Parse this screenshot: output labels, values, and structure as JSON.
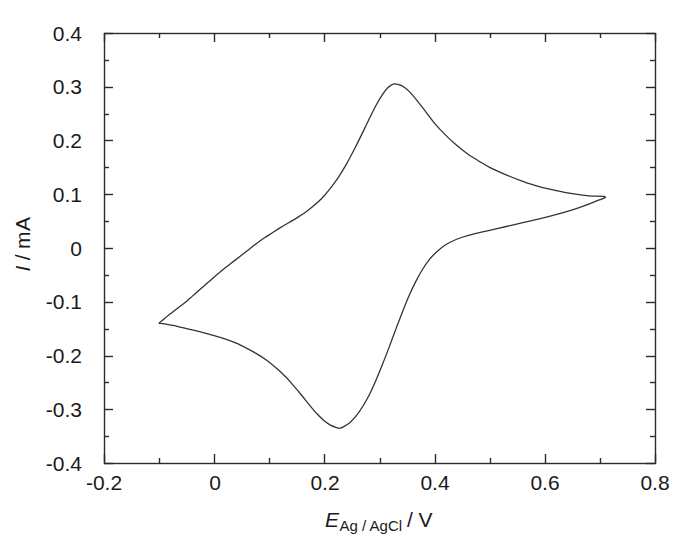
{
  "chart_data": {
    "type": "line",
    "title": "",
    "subtitle": "",
    "xlabel": "E_Ag/AgCl / V",
    "xlabel_parts": {
      "symbol": "E",
      "subscript": "Ag / AgCl",
      "separator": "/",
      "unit": "V"
    },
    "ylabel": "I / mA",
    "ylabel_parts": {
      "symbol": "I",
      "separator": "/",
      "unit": "mA"
    },
    "xlim": [
      -0.2,
      0.8
    ],
    "ylim": [
      -0.4,
      0.4
    ],
    "grid": false,
    "legend": "none",
    "x_major_ticks": [
      -0.2,
      0,
      0.2,
      0.4,
      0.6,
      0.8
    ],
    "x_tick_labels": [
      "-0.2",
      "0",
      "0.2",
      "0.4",
      "0.6",
      "0.8"
    ],
    "x_minor_ticks": [
      -0.1,
      0.1,
      0.3,
      0.5,
      0.7
    ],
    "y_major_ticks": [
      0.4,
      0.3,
      0.2,
      0.1,
      0,
      -0.1,
      -0.2,
      -0.3,
      -0.4
    ],
    "y_tick_labels": [
      "0.4",
      "0.3",
      "0.2",
      "0.1",
      "0",
      "-0.1",
      "-0.2",
      "-0.3",
      "-0.4"
    ],
    "y_minor_ticks": [
      0.35,
      0.25,
      0.15,
      0.05,
      -0.05,
      -0.15,
      -0.25,
      -0.35
    ],
    "tick_direction": "in",
    "frame": "box",
    "line_color": "#333333",
    "line_width_px": 1.3,
    "annotations": {
      "anodic_peak": {
        "x": 0.325,
        "y": 0.305,
        "label": "anodic peak current"
      },
      "cathodic_peak": {
        "x": 0.229,
        "y": -0.335,
        "label": "cathodic peak current"
      },
      "anodic_switching_potential": {
        "x": 0.71,
        "y": 0.095
      },
      "cathodic_switching_potential": {
        "x": -0.1,
        "y": -0.14
      }
    },
    "series": [
      {
        "name": "forward scan (anodic, -0.1 V to 0.71 V)",
        "direction": "anodic",
        "points": [
          [
            -0.1,
            -0.14
          ],
          [
            -0.09,
            -0.131
          ],
          [
            -0.08,
            -0.123
          ],
          [
            -0.07,
            -0.115
          ],
          [
            -0.06,
            -0.107
          ],
          [
            -0.05,
            -0.099
          ],
          [
            -0.04,
            -0.09
          ],
          [
            -0.03,
            -0.081
          ],
          [
            -0.02,
            -0.072
          ],
          [
            -0.01,
            -0.063
          ],
          [
            0.0,
            -0.054
          ],
          [
            0.015,
            -0.041
          ],
          [
            0.03,
            -0.029
          ],
          [
            0.045,
            -0.017
          ],
          [
            0.06,
            -0.005
          ],
          [
            0.075,
            0.007
          ],
          [
            0.09,
            0.018
          ],
          [
            0.105,
            0.028
          ],
          [
            0.12,
            0.038
          ],
          [
            0.135,
            0.047
          ],
          [
            0.15,
            0.056
          ],
          [
            0.165,
            0.066
          ],
          [
            0.18,
            0.078
          ],
          [
            0.195,
            0.092
          ],
          [
            0.21,
            0.11
          ],
          [
            0.225,
            0.131
          ],
          [
            0.24,
            0.156
          ],
          [
            0.255,
            0.185
          ],
          [
            0.27,
            0.216
          ],
          [
            0.285,
            0.248
          ],
          [
            0.295,
            0.268
          ],
          [
            0.305,
            0.285
          ],
          [
            0.315,
            0.298
          ],
          [
            0.325,
            0.305
          ],
          [
            0.335,
            0.304
          ],
          [
            0.345,
            0.299
          ],
          [
            0.355,
            0.29
          ],
          [
            0.37,
            0.272
          ],
          [
            0.385,
            0.252
          ],
          [
            0.4,
            0.232
          ],
          [
            0.42,
            0.21
          ],
          [
            0.44,
            0.191
          ],
          [
            0.46,
            0.175
          ],
          [
            0.48,
            0.162
          ],
          [
            0.5,
            0.15
          ],
          [
            0.53,
            0.136
          ],
          [
            0.56,
            0.124
          ],
          [
            0.59,
            0.114
          ],
          [
            0.62,
            0.107
          ],
          [
            0.65,
            0.101
          ],
          [
            0.68,
            0.097
          ],
          [
            0.71,
            0.095
          ]
        ]
      },
      {
        "name": "reverse scan (cathodic, 0.71 V to -0.1 V)",
        "direction": "cathodic",
        "points": [
          [
            0.71,
            0.095
          ],
          [
            0.69,
            0.086
          ],
          [
            0.67,
            0.078
          ],
          [
            0.65,
            0.071
          ],
          [
            0.62,
            0.062
          ],
          [
            0.59,
            0.054
          ],
          [
            0.56,
            0.047
          ],
          [
            0.53,
            0.04
          ],
          [
            0.5,
            0.033
          ],
          [
            0.47,
            0.026
          ],
          [
            0.45,
            0.02
          ],
          [
            0.435,
            0.014
          ],
          [
            0.42,
            0.006
          ],
          [
            0.405,
            -0.006
          ],
          [
            0.39,
            -0.022
          ],
          [
            0.378,
            -0.04
          ],
          [
            0.366,
            -0.062
          ],
          [
            0.354,
            -0.088
          ],
          [
            0.342,
            -0.118
          ],
          [
            0.33,
            -0.15
          ],
          [
            0.318,
            -0.183
          ],
          [
            0.306,
            -0.215
          ],
          [
            0.294,
            -0.245
          ],
          [
            0.282,
            -0.272
          ],
          [
            0.27,
            -0.294
          ],
          [
            0.258,
            -0.312
          ],
          [
            0.246,
            -0.325
          ],
          [
            0.234,
            -0.333
          ],
          [
            0.229,
            -0.335
          ],
          [
            0.222,
            -0.334
          ],
          [
            0.21,
            -0.329
          ],
          [
            0.198,
            -0.32
          ],
          [
            0.186,
            -0.308
          ],
          [
            0.172,
            -0.291
          ],
          [
            0.158,
            -0.273
          ],
          [
            0.144,
            -0.256
          ],
          [
            0.13,
            -0.24
          ],
          [
            0.112,
            -0.223
          ],
          [
            0.094,
            -0.208
          ],
          [
            0.076,
            -0.196
          ],
          [
            0.058,
            -0.186
          ],
          [
            0.04,
            -0.177
          ],
          [
            0.022,
            -0.17
          ],
          [
            0.0,
            -0.163
          ],
          [
            -0.025,
            -0.156
          ],
          [
            -0.05,
            -0.15
          ],
          [
            -0.075,
            -0.144
          ],
          [
            -0.09,
            -0.141
          ],
          [
            -0.1,
            -0.14
          ]
        ]
      }
    ]
  }
}
